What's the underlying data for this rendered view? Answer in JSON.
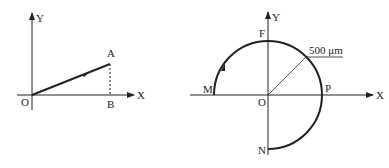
{
  "left_diagram": {
    "axis_x_label": "X",
    "axis_y_label": "Y",
    "origin_label": "O",
    "point_a_label": "A",
    "point_b_label": "B"
  },
  "right_diagram": {
    "axis_x_label": "X",
    "axis_y_label": "Y",
    "origin_label": "O",
    "point_f_label": "F",
    "point_m_label": "M",
    "point_p_label": "P",
    "point_n_label": "N",
    "radius_label": "500 μm"
  },
  "colors": {
    "line": "#222222",
    "background": "#ffffff"
  }
}
